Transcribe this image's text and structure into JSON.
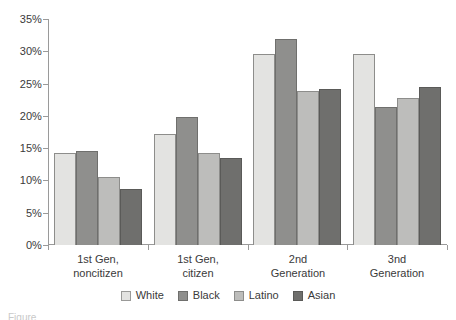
{
  "chart_data": {
    "type": "bar",
    "title": "",
    "subtitle": "",
    "xlabel": "",
    "ylabel": "",
    "categories": [
      "1st Gen, noncitizen",
      "1st Gen, citizen",
      "2nd Generation",
      "3nd Generation"
    ],
    "category_lines": [
      [
        "1st Gen,",
        "noncitizen"
      ],
      [
        "1st Gen,",
        "citizen"
      ],
      [
        "2nd",
        "Generation"
      ],
      [
        "3nd",
        "Generation"
      ]
    ],
    "series": [
      {
        "name": "White",
        "color": "#e3e3e1",
        "values": [
          14.2,
          17.2,
          29.6,
          29.6
        ]
      },
      {
        "name": "Black",
        "color": "#8f8f8d",
        "values": [
          14.5,
          19.8,
          31.9,
          21.3
        ]
      },
      {
        "name": "Latino",
        "color": "#bdbdbb",
        "values": [
          10.6,
          14.3,
          23.9,
          22.7
        ]
      },
      {
        "name": "Asian",
        "color": "#6f6f6d",
        "values": [
          8.6,
          13.5,
          24.2,
          24.5
        ]
      }
    ],
    "ylim": [
      0,
      35
    ],
    "ytick_values": [
      0,
      5,
      10,
      15,
      20,
      25,
      30,
      35
    ],
    "ytick_labels": [
      "0%",
      "5%",
      "10%",
      "15%",
      "20%",
      "25%",
      "30%",
      "35%"
    ],
    "value_suffix": "%",
    "grid": false,
    "legend_position": "bottom",
    "legend_entries": [
      "White",
      "Black",
      "Latino",
      "Asian"
    ]
  },
  "caption": {
    "text": "Figure"
  }
}
